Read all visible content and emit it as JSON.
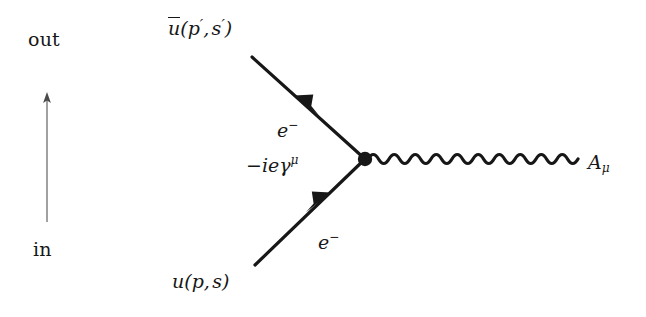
{
  "figure": {
    "type": "feynman-diagram",
    "background_color": "#ffffff",
    "line_color": "#171717",
    "axis_color": "#6f6f6f",
    "width": 646,
    "height": 317
  },
  "time_axis": {
    "name": "time-direction-axis",
    "out_label": "out",
    "in_label": "in",
    "direction": "upward",
    "x": 47,
    "y_top": 95,
    "y_bottom": 222
  },
  "labels": {
    "outgoing_spinor": {
      "text": "ū(p′, s′)",
      "u": "u",
      "open_paren": "(",
      "p": "p",
      "p_prime": "′",
      "comma": ",",
      "s": "s",
      "s_prime": "′",
      "close_paren": ")"
    },
    "incoming_spinor": {
      "text": "u(p, s)",
      "u": "u",
      "open_paren": "(",
      "p": "p",
      "comma": ",",
      "s": "s",
      "close_paren": ")"
    },
    "electron_out": {
      "text": "e⁻",
      "base": "e",
      "sup": "−"
    },
    "electron_in": {
      "text": "e⁻",
      "base": "e",
      "sup": "−"
    },
    "vertex_factor": {
      "text": "−ieγμ",
      "minus": "−",
      "i": "i",
      "e": "e",
      "gamma": "γ",
      "mu_sup": "μ"
    },
    "photon_field": {
      "text": "Aμ",
      "base": "A",
      "sub": "μ"
    }
  },
  "vertex": {
    "name": "interaction-vertex",
    "x": 365,
    "y": 159,
    "radius": 7
  },
  "lines": {
    "outgoing_fermion": {
      "name": "outgoing-electron-line",
      "x1": 252,
      "y1": 57,
      "x2": 365,
      "y2": 159,
      "arrow_direction": "up-left",
      "arrow_position": 0.46,
      "width": 3.2
    },
    "incoming_fermion": {
      "name": "incoming-electron-line",
      "x1": 255,
      "y1": 265,
      "x2": 365,
      "y2": 159,
      "arrow_direction": "up-right",
      "arrow_position": 0.55,
      "width": 3.2
    },
    "photon": {
      "name": "photon-wavy-line",
      "x1": 368,
      "y1": 159,
      "x2": 578,
      "y2": 159,
      "cycles": 10,
      "amplitude": 7,
      "width": 3.2
    }
  }
}
